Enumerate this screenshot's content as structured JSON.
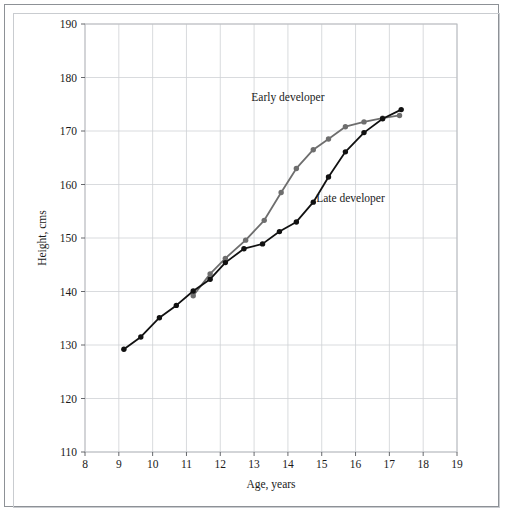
{
  "figure": {
    "background_color": "#ffffff",
    "frame_color": "#8d9196"
  },
  "chart_data": {
    "type": "line",
    "title": "",
    "xlabel": "Age, years",
    "ylabel": "Height, cms",
    "xlim": [
      8,
      19
    ],
    "ylim": [
      110,
      190
    ],
    "xticks": [
      8,
      9,
      10,
      11,
      12,
      13,
      14,
      15,
      16,
      17,
      18,
      19
    ],
    "yticks": [
      110,
      120,
      130,
      140,
      150,
      160,
      170,
      180,
      190
    ],
    "grid": true,
    "grid_color": "#cfd2d6",
    "legend_position": "inline-annotation",
    "series": [
      {
        "name": "Early developer",
        "color": "#6e6e6e",
        "marker": "circle",
        "annotation": "Early developer",
        "annotation_x": 14.0,
        "annotation_y": 175.6,
        "x": [
          11.2,
          11.7,
          12.15,
          12.75,
          13.3,
          13.8,
          14.25,
          14.75,
          15.2,
          15.7,
          16.25,
          16.8,
          17.3
        ],
        "y": [
          139.2,
          143.3,
          146.2,
          149.6,
          153.3,
          158.5,
          163.0,
          166.5,
          168.5,
          170.8,
          171.7,
          172.4,
          172.9
        ]
      },
      {
        "name": "Late developer",
        "color": "#111111",
        "marker": "circle",
        "annotation": "Late developer",
        "annotation_x": 15.85,
        "annotation_y": 156.8,
        "x": [
          9.15,
          9.65,
          10.2,
          10.7,
          11.2,
          11.7,
          12.15,
          12.7,
          13.25,
          13.75,
          14.25,
          14.75,
          15.2,
          15.7,
          16.25,
          16.8,
          17.35
        ],
        "y": [
          129.2,
          131.5,
          135.1,
          137.4,
          140.1,
          142.3,
          145.4,
          148.0,
          148.9,
          151.2,
          153.0,
          156.7,
          161.4,
          166.1,
          169.7,
          172.3,
          174.0
        ]
      }
    ]
  }
}
